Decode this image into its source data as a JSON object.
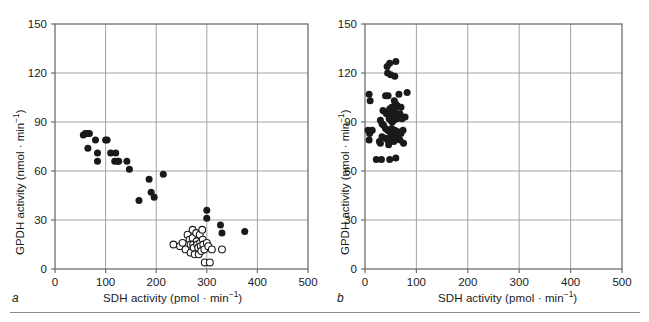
{
  "figure": {
    "background_color": "#ffffff",
    "rule_color": "#8a8a8a",
    "axis_color": "#6e6e6e",
    "grid_color": "#9a9a9a",
    "marker_filled_color": "#1a1a1a",
    "marker_open_color": "#ffffff"
  },
  "panels": [
    {
      "letter": "a",
      "xlabel_prefix": "SDH activity (pmol · min",
      "xlabel_exponent": "−1",
      "xlabel_suffix": ")",
      "ylabel_prefix": "GPDH activity (nmol · min",
      "ylabel_exponent": "−1",
      "ylabel_suffix": ")"
    },
    {
      "letter": "b",
      "xlabel_prefix": "SDH activity (pmol · min",
      "xlabel_exponent": "−1",
      "xlabel_suffix": ")",
      "ylabel_prefix": "GPDH activity (nmol · min",
      "ylabel_exponent": "−1",
      "ylabel_suffix": ")"
    }
  ],
  "chart_data": [
    {
      "panel": "a",
      "type": "scatter",
      "title": "",
      "xlabel": "SDH activity (pmol · min⁻¹)",
      "ylabel": "GPDH activity (nmol · min⁻¹)",
      "xlim": [
        0,
        500
      ],
      "ylim": [
        0,
        150
      ],
      "xticks": [
        0,
        100,
        200,
        300,
        400,
        500
      ],
      "yticks": [
        0,
        30,
        60,
        90,
        120,
        150
      ],
      "xtick_labels": [
        "0",
        "100",
        "200",
        "300",
        "400",
        "500"
      ],
      "ytick_labels": [
        "0",
        "30",
        "60",
        "90",
        "120",
        "150"
      ],
      "grid": true,
      "grid_axes": "both",
      "legend": null,
      "series": [
        {
          "name": "filled circles",
          "marker": "filled-circle",
          "points": [
            [
              56,
              82
            ],
            [
              60,
              83
            ],
            [
              63,
              83
            ],
            [
              66,
              83
            ],
            [
              68,
              83
            ],
            [
              65,
              74
            ],
            [
              80,
              79
            ],
            [
              84,
              71
            ],
            [
              84,
              66
            ],
            [
              100,
              79
            ],
            [
              103,
              79
            ],
            [
              110,
              71
            ],
            [
              120,
              71
            ],
            [
              118,
              66
            ],
            [
              124,
              66
            ],
            [
              126,
              66
            ],
            [
              142,
              66
            ],
            [
              147,
              61
            ],
            [
              166,
              42
            ],
            [
              186,
              55
            ],
            [
              190,
              47
            ],
            [
              196,
              44
            ],
            [
              214,
              58
            ],
            [
              300,
              36
            ],
            [
              300,
              31
            ],
            [
              327,
              27
            ],
            [
              330,
              22
            ],
            [
              375,
              23
            ]
          ]
        },
        {
          "name": "open circles",
          "marker": "open-circle",
          "points": [
            [
              234,
              15
            ],
            [
              247,
              14
            ],
            [
              252,
              16
            ],
            [
              258,
              12
            ],
            [
              262,
              21
            ],
            [
              266,
              18
            ],
            [
              268,
              15
            ],
            [
              268,
              10
            ],
            [
              272,
              24
            ],
            [
              272,
              19
            ],
            [
              273,
              15
            ],
            [
              274,
              13
            ],
            [
              276,
              9
            ],
            [
              279,
              22
            ],
            [
              280,
              17
            ],
            [
              281,
              15
            ],
            [
              283,
              13
            ],
            [
              284,
              9
            ],
            [
              286,
              21
            ],
            [
              287,
              16
            ],
            [
              288,
              14
            ],
            [
              289,
              11
            ],
            [
              291,
              24
            ],
            [
              292,
              18
            ],
            [
              293,
              15
            ],
            [
              295,
              12
            ],
            [
              296,
              4
            ],
            [
              300,
              16
            ],
            [
              303,
              14
            ],
            [
              306,
              4
            ],
            [
              310,
              12
            ],
            [
              330,
              12
            ]
          ]
        }
      ]
    },
    {
      "panel": "b",
      "type": "scatter",
      "title": "",
      "xlabel": "SDH activity (pmol · min⁻¹)",
      "ylabel": "GPDH activity (nmol · min⁻¹)",
      "xlim": [
        0,
        500
      ],
      "ylim": [
        0,
        150
      ],
      "xticks": [
        0,
        100,
        200,
        300,
        400,
        500
      ],
      "yticks": [
        0,
        30,
        60,
        90,
        120,
        150
      ],
      "xtick_labels": [
        "0",
        "100",
        "200",
        "300",
        "400",
        "500"
      ],
      "ytick_labels": [
        "0",
        "30",
        "60",
        "90",
        "120",
        "150"
      ],
      "grid": true,
      "grid_axes": "both",
      "legend": null,
      "series": [
        {
          "name": "filled circles",
          "marker": "filled-circle",
          "points": [
            [
              43,
              124
            ],
            [
              48,
              126
            ],
            [
              60,
              127
            ],
            [
              44,
              120
            ],
            [
              50,
              119
            ],
            [
              58,
              118
            ],
            [
              8,
              107
            ],
            [
              10,
              103
            ],
            [
              40,
              106
            ],
            [
              45,
              106
            ],
            [
              66,
              107
            ],
            [
              82,
              108
            ],
            [
              57,
              103
            ],
            [
              60,
              101
            ],
            [
              63,
              100
            ],
            [
              70,
              99
            ],
            [
              35,
              97
            ],
            [
              40,
              96
            ],
            [
              42,
              95
            ],
            [
              48,
              98
            ],
            [
              50,
              96
            ],
            [
              52,
              99
            ],
            [
              55,
              94
            ],
            [
              58,
              97
            ],
            [
              60,
              93
            ],
            [
              47,
              92
            ],
            [
              50,
              91
            ],
            [
              53,
              90
            ],
            [
              56,
              91
            ],
            [
              62,
              92
            ],
            [
              68,
              95
            ],
            [
              72,
              92
            ],
            [
              78,
              93
            ],
            [
              30,
              91
            ],
            [
              33,
              89
            ],
            [
              36,
              88
            ],
            [
              6,
              85
            ],
            [
              9,
              83
            ],
            [
              14,
              85
            ],
            [
              40,
              86
            ],
            [
              44,
              85
            ],
            [
              48,
              84
            ],
            [
              52,
              86
            ],
            [
              55,
              83
            ],
            [
              58,
              85
            ],
            [
              64,
              84
            ],
            [
              70,
              83
            ],
            [
              74,
              85
            ],
            [
              8,
              79
            ],
            [
              28,
              78
            ],
            [
              33,
              81
            ],
            [
              40,
              80
            ],
            [
              44,
              79
            ],
            [
              50,
              81
            ],
            [
              56,
              78
            ],
            [
              62,
              80
            ],
            [
              68,
              79
            ],
            [
              75,
              77
            ],
            [
              30,
              77
            ],
            [
              46,
              76
            ],
            [
              22,
              67
            ],
            [
              32,
              67
            ],
            [
              48,
              67
            ],
            [
              60,
              68
            ]
          ]
        }
      ]
    }
  ]
}
